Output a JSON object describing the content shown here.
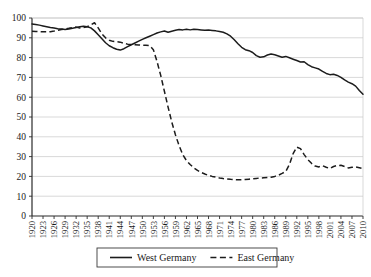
{
  "chart_data": {
    "type": "line",
    "title": "",
    "xlabel": "",
    "ylabel": "",
    "ylim": [
      0,
      100
    ],
    "xlim": [
      1920,
      2010
    ],
    "ytick_labels": [
      "0",
      "10",
      "20",
      "30",
      "40",
      "50",
      "60",
      "70",
      "80",
      "90",
      "100"
    ],
    "ytick_values": [
      0,
      10,
      20,
      30,
      40,
      50,
      60,
      70,
      80,
      90,
      100
    ],
    "xtick_labels": [
      "1920",
      "1923",
      "1926",
      "1929",
      "1932",
      "1935",
      "1938",
      "1941",
      "1944",
      "1947",
      "1950",
      "1953",
      "1956",
      "1959",
      "1962",
      "1965",
      "1968",
      "1971",
      "1974",
      "1977",
      "1980",
      "1983",
      "1986",
      "1989",
      "1992",
      "1995",
      "1998",
      "2001",
      "2004",
      "2007",
      "2010"
    ],
    "xtick_values": [
      1920,
      1923,
      1926,
      1929,
      1932,
      1935,
      1938,
      1941,
      1944,
      1947,
      1950,
      1953,
      1956,
      1959,
      1962,
      1965,
      1968,
      1971,
      1974,
      1977,
      1980,
      1983,
      1986,
      1989,
      1992,
      1995,
      1998,
      2001,
      2004,
      2007,
      2010
    ],
    "grid": true,
    "legend_position": "bottom-center",
    "x": [
      1920,
      1921,
      1922,
      1923,
      1924,
      1925,
      1926,
      1927,
      1928,
      1929,
      1930,
      1931,
      1932,
      1933,
      1934,
      1935,
      1936,
      1937,
      1938,
      1939,
      1940,
      1941,
      1942,
      1943,
      1944,
      1945,
      1946,
      1947,
      1948,
      1949,
      1950,
      1951,
      1952,
      1953,
      1954,
      1955,
      1956,
      1957,
      1958,
      1959,
      1960,
      1961,
      1962,
      1963,
      1964,
      1965,
      1966,
      1967,
      1968,
      1969,
      1970,
      1971,
      1972,
      1973,
      1974,
      1975,
      1976,
      1977,
      1978,
      1979,
      1980,
      1981,
      1982,
      1983,
      1984,
      1985,
      1986,
      1987,
      1988,
      1989,
      1990,
      1991,
      1992,
      1993,
      1994,
      1995,
      1996,
      1997,
      1998,
      1999,
      2000,
      2001,
      2002,
      2003,
      2004,
      2005,
      2006,
      2007,
      2008,
      2009,
      2010
    ],
    "series": [
      {
        "name": "West Germany",
        "style": "solid",
        "color": "#1c1c1c",
        "values": [
          97.0,
          96.7,
          96.4,
          96.0,
          95.6,
          95.2,
          94.9,
          94.6,
          94.4,
          94.2,
          94.4,
          94.8,
          95.2,
          95.6,
          95.8,
          95.6,
          95.0,
          93.5,
          91.5,
          89.5,
          87.5,
          86.0,
          85.0,
          84.2,
          83.8,
          84.5,
          85.5,
          86.5,
          87.4,
          88.3,
          89.2,
          90.0,
          90.8,
          91.6,
          92.4,
          93.0,
          93.4,
          92.8,
          93.3,
          93.8,
          94.2,
          94.0,
          94.3,
          94.0,
          94.3,
          94.2,
          94.0,
          93.8,
          93.9,
          93.7,
          93.5,
          93.2,
          92.8,
          92.0,
          90.8,
          89.0,
          87.0,
          85.2,
          84.0,
          83.5,
          82.6,
          81.0,
          80.2,
          80.4,
          81.3,
          81.8,
          81.4,
          80.8,
          80.2,
          80.6,
          79.9,
          79.2,
          78.5,
          77.8,
          77.9,
          76.5,
          75.4,
          74.8,
          74.2,
          73.0,
          72.0,
          71.4,
          71.6,
          71.0,
          70.0,
          68.7,
          67.6,
          66.8,
          65.6,
          63.4,
          61.5
        ]
      },
      {
        "name": "East Germany",
        "style": "dashed",
        "color": "#1c1c1c",
        "values": [
          93.3,
          93.2,
          93.1,
          93.0,
          93.0,
          93.1,
          93.4,
          93.8,
          94.2,
          94.5,
          94.8,
          95.2,
          95.4,
          95.0,
          95.2,
          95.6,
          96.6,
          97.6,
          95.0,
          92.0,
          90.0,
          88.8,
          88.2,
          88.0,
          87.8,
          87.2,
          86.8,
          86.6,
          86.5,
          86.4,
          86.3,
          86.2,
          86.0,
          84.0,
          78.0,
          71.0,
          63.0,
          55.0,
          47.5,
          41.0,
          35.5,
          31.0,
          28.0,
          26.0,
          24.3,
          23.0,
          22.0,
          21.2,
          20.5,
          20.0,
          19.6,
          19.2,
          18.9,
          18.7,
          18.5,
          18.4,
          18.3,
          18.3,
          18.4,
          18.6,
          18.8,
          19.0,
          19.2,
          19.3,
          19.4,
          19.6,
          20.0,
          20.6,
          21.5,
          22.5,
          26.0,
          31.5,
          34.8,
          34.0,
          31.0,
          28.5,
          26.6,
          25.2,
          24.8,
          25.4,
          24.6,
          24.0,
          25.0,
          25.5,
          25.6,
          25.0,
          24.3,
          24.6,
          24.8,
          24.4,
          24.0
        ]
      }
    ],
    "legend": [
      {
        "label": "West Germany",
        "style": "solid"
      },
      {
        "label": "East Germany",
        "style": "dashed"
      }
    ]
  }
}
